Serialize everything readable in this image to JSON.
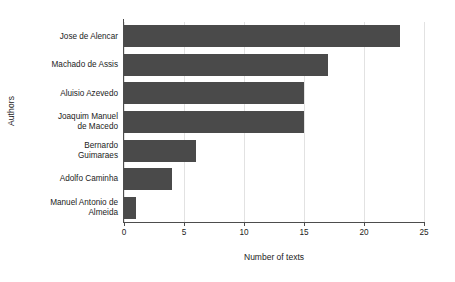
{
  "chart_data": {
    "type": "bar",
    "orientation": "horizontal",
    "title": "",
    "xlabel": "Number of texts",
    "ylabel": "Authors",
    "categories": [
      "Jose de Alencar",
      "Machado de Assis",
      "Aluisio Azevedo",
      "Joaquim Manuel de Macedo",
      "Bernardo Guimaraes",
      "Adolfo Caminha",
      "Manuel Antonio de Almeida"
    ],
    "category_lines": [
      [
        "Jose de Alencar"
      ],
      [
        "Machado de Assis"
      ],
      [
        "Aluisio Azevedo"
      ],
      [
        "Joaquim Manuel",
        "de Macedo"
      ],
      [
        "Bernardo",
        "Guimaraes"
      ],
      [
        "Adolfo Caminha"
      ],
      [
        "Manuel Antonio de",
        "Almeida"
      ]
    ],
    "values": [
      23,
      17,
      15,
      15,
      6,
      4,
      1
    ],
    "xlim": [
      0,
      25
    ],
    "xticks": [
      0,
      5,
      10,
      15,
      20,
      25
    ],
    "xtick_labels": [
      "0",
      "5",
      "10",
      "15",
      "20",
      "25"
    ],
    "grid": "vertical",
    "legend": "none",
    "bar_color": "#4a4a4a",
    "grid_color": "#e2e2e2",
    "axis_color": "#4d4d4d",
    "background_color": "#ffffff"
  }
}
